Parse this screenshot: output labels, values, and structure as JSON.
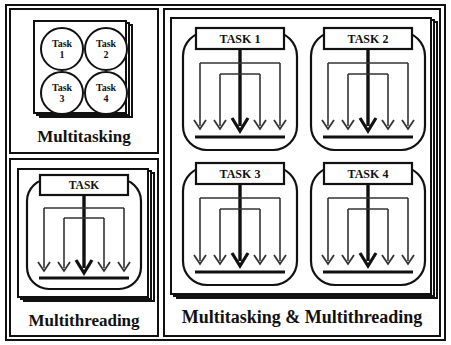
{
  "diagram": {
    "stroke_color": "#111111",
    "background_color": "#ffffff"
  },
  "panels": {
    "multitasking": {
      "label": "Multitasking",
      "tasks": [
        {
          "line1": "Task",
          "line2": "1"
        },
        {
          "line1": "Task",
          "line2": "2"
        },
        {
          "line1": "Task",
          "line2": "3"
        },
        {
          "line1": "Task",
          "line2": "4"
        }
      ]
    },
    "multithreading": {
      "label": "Multithreading",
      "task_box_label": "TASK",
      "thread_count": 5
    },
    "multitasking_multithreading": {
      "label": "Multitasking & Multithreading",
      "units": [
        {
          "task_box_label": "TASK 1",
          "thread_count": 5
        },
        {
          "task_box_label": "TASK 2",
          "thread_count": 5
        },
        {
          "task_box_label": "TASK 3",
          "thread_count": 5
        },
        {
          "task_box_label": "TASK 4",
          "thread_count": 5
        }
      ]
    }
  }
}
